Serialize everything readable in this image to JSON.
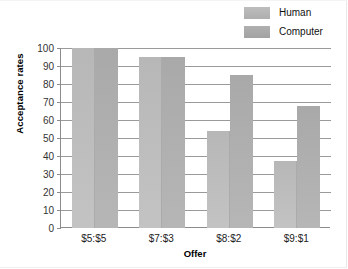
{
  "chart_data": {
    "type": "bar",
    "title": "",
    "xlabel": "Offer",
    "ylabel": "Acceptance rates",
    "categories": [
      "$5:$5",
      "$7:$3",
      "$8:$2",
      "$9:$1"
    ],
    "series": [
      {
        "name": "Human",
        "values": [
          100,
          95,
          54,
          37.5
        ],
        "color": "#bdbdbd"
      },
      {
        "name": "Computer",
        "values": [
          100,
          95,
          85,
          68
        ],
        "color": "#ababab"
      }
    ],
    "ylim": [
      0,
      100
    ],
    "yticks": [
      0,
      10,
      20,
      30,
      40,
      50,
      60,
      70,
      80,
      90,
      100
    ],
    "ytick_labels": [
      "0",
      "10",
      "20",
      "30",
      "40",
      "50",
      "60",
      "70",
      "80",
      "90",
      "100"
    ],
    "grid": true,
    "legend_position": "top-right"
  },
  "legend": {
    "items": [
      {
        "label": "Human"
      },
      {
        "label": "Computer"
      }
    ]
  }
}
